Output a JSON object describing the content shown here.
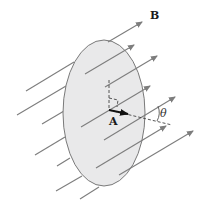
{
  "diagram": {
    "type": "magnetic-flux-through-surface",
    "labels": {
      "field": "B",
      "area_vector": "A",
      "angle": "θ"
    },
    "colors": {
      "background": "#ffffff",
      "surface_fill": "#e9e9ea",
      "surface_stroke": "#7a7a7a",
      "field_line": "#7d7d7d",
      "area_vector": "#111111",
      "dashed": "#444444"
    }
  }
}
